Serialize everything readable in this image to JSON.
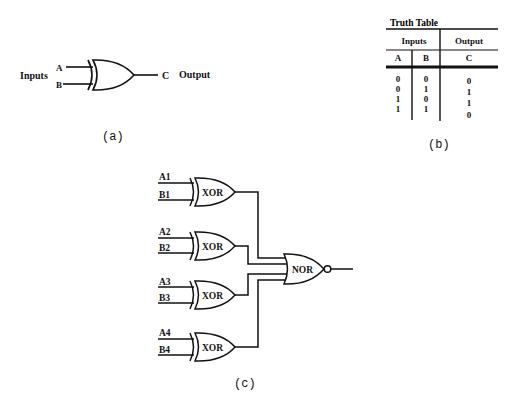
{
  "panel_a": {
    "inputs_label": "Inputs",
    "input_a": "A",
    "input_b": "B",
    "output_c": "C",
    "output_label": "Output",
    "caption": "(a)"
  },
  "panel_b": {
    "title": "Truth Table",
    "group_inputs": "Inputs",
    "group_output": "Output",
    "col_a": "A",
    "col_b": "B",
    "col_c": "C",
    "rows": [
      {
        "a": "0",
        "b": "0",
        "c": "0"
      },
      {
        "a": "0",
        "b": "1",
        "c": "1"
      },
      {
        "a": "1",
        "b": "0",
        "c": "1"
      },
      {
        "a": "1",
        "b": "1",
        "c": "0"
      }
    ],
    "caption": "(b)"
  },
  "panel_c": {
    "xor_gates": [
      {
        "label": "XOR",
        "in_a": "A1",
        "in_b": "B1"
      },
      {
        "label": "XOR",
        "in_a": "A2",
        "in_b": "B2"
      },
      {
        "label": "XOR",
        "in_a": "A3",
        "in_b": "B3"
      },
      {
        "label": "XOR",
        "in_a": "A4",
        "in_b": "B4"
      }
    ],
    "nor_label": "NOR",
    "caption": "(c)"
  }
}
